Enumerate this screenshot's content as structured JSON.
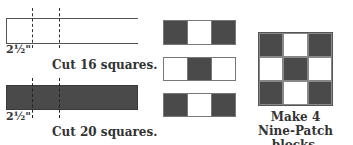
{
  "colors": {
    "dark_fabric": "#4a4a4a",
    "light_fabric": "#ffffff",
    "line": "#333333"
  },
  "strips": [
    {
      "fabric": "light",
      "dimension_label": "2½\"",
      "caption": "Cut 16 squares."
    },
    {
      "fabric": "dark",
      "dimension_label": "2½\"",
      "caption": "Cut 20 squares."
    }
  ],
  "strip_sets": [
    {
      "cells": [
        "dark",
        "light",
        "dark"
      ]
    },
    {
      "cells": [
        "light",
        "dark",
        "light"
      ]
    },
    {
      "cells": [
        "dark",
        "light",
        "dark"
      ]
    }
  ],
  "block": {
    "cells": [
      "dark",
      "light",
      "dark",
      "light",
      "dark",
      "light",
      "dark",
      "light",
      "dark"
    ],
    "caption_line1": "Make 4",
    "caption_line2": "Nine-Patch blocks."
  }
}
